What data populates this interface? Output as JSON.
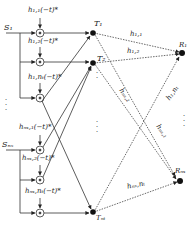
{
  "diagram": {
    "type": "beamforming-network",
    "colors": {
      "line": "#333333",
      "node": "#111111",
      "background": "#ffffff"
    },
    "sources": [
      {
        "id": "S1",
        "label": "S₁"
      },
      {
        "id": "Sns",
        "label": "Sₙₛ"
      }
    ],
    "filter_labels": [
      {
        "label": "h₁,₁(−t)*"
      },
      {
        "label": "h₁,₂(−t)*"
      },
      {
        "label": "h₁,nₜ(−t)*"
      },
      {
        "label": "hₙₛ,₁(−t)*"
      },
      {
        "label": "hₙₛ,₂(−t)*"
      },
      {
        "label": "hₙₛ,nₜ(−t)*"
      }
    ],
    "transmitters": [
      {
        "id": "T1",
        "label": "T₁"
      },
      {
        "id": "T2",
        "label": "T₂"
      },
      {
        "id": "Tnt",
        "label": "Tₙₜ"
      }
    ],
    "receivers": [
      {
        "id": "R1",
        "label": "R₁"
      },
      {
        "id": "Rnr",
        "label": "Rₙₛ"
      }
    ],
    "channel_labels": [
      {
        "label": "h₁,₁"
      },
      {
        "label": "h₁,₂"
      },
      {
        "label": "hₙₛ,₂"
      },
      {
        "label": "h₁,nₜ"
      },
      {
        "label": "hₙₛ,₁"
      },
      {
        "label": "hₙₛ,nₜ"
      }
    ],
    "ellipsis": "⋮"
  }
}
